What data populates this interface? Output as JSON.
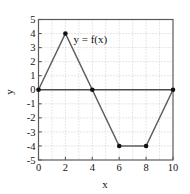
{
  "chart_data": {
    "type": "line",
    "title": "",
    "subtitle": "",
    "xlabel": "x",
    "ylabel": "y",
    "xlim": [
      0,
      10
    ],
    "ylim": [
      -5,
      5
    ],
    "xticks": [
      "0",
      "2",
      "4",
      "6",
      "8",
      "10"
    ],
    "xtick_values": [
      0,
      2,
      4,
      6,
      8,
      10
    ],
    "yticks": [
      "5",
      "4",
      "3",
      "2",
      "1",
      "0",
      "-1",
      "-2",
      "-3",
      "-4",
      "-5"
    ],
    "ytick_values": [
      5,
      4,
      3,
      2,
      1,
      0,
      -1,
      -2,
      -3,
      -4,
      -5
    ],
    "grid": true,
    "grid_style": "dotted",
    "legend": "none",
    "annotations": [
      {
        "text": "y = f(x)",
        "x": 2.6,
        "y": 3.35
      }
    ],
    "series": [
      {
        "name": "y = f(x)",
        "x": [
          0,
          2,
          4,
          6,
          8,
          10
        ],
        "values": [
          0,
          4,
          0,
          -4,
          -4,
          0
        ],
        "marker": "filled-circle",
        "line_color": "#5e5e5e",
        "marker_color": "#111111"
      }
    ],
    "colors": {
      "background": "#ffffff",
      "frame": "#5a5a5a",
      "gridline": "#b9b9b9",
      "zero_axis": "#4a4a4a",
      "text": "#141414"
    }
  }
}
